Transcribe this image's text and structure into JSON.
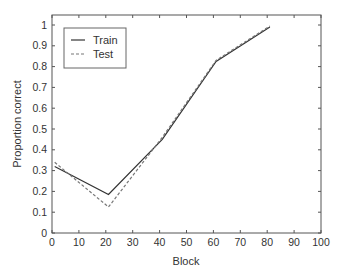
{
  "chart_data": {
    "type": "line",
    "title": "",
    "xlabel": "Block",
    "ylabel": "Proportion correct",
    "xlim": [
      0,
      100
    ],
    "ylim": [
      0,
      1
    ],
    "xticks": [
      0,
      10,
      20,
      30,
      40,
      50,
      60,
      70,
      80,
      90,
      100
    ],
    "yticks": [
      0,
      0.1,
      0.2,
      0.3,
      0.4,
      0.5,
      0.6,
      0.7,
      0.8,
      0.9,
      1
    ],
    "ytick_labels": [
      "0",
      "0.1",
      "0.2",
      "0.3",
      "0.4",
      "0.5",
      "0.6",
      "0.7",
      "0.8",
      "0.9",
      "1"
    ],
    "grid": false,
    "legend_position": "upper left",
    "x": [
      1,
      21,
      41,
      61,
      81
    ],
    "series": [
      {
        "name": "Train",
        "style": "solid",
        "color": "#333333",
        "values": [
          0.32,
          0.185,
          0.45,
          0.825,
          0.99
        ]
      },
      {
        "name": "Test",
        "style": "dashed",
        "color": "#777777",
        "values": [
          0.34,
          0.125,
          0.46,
          0.83,
          0.995
        ]
      }
    ]
  }
}
